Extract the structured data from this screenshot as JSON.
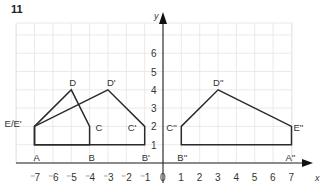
{
  "question_number": "11",
  "chart_data": {
    "type": "diagram",
    "title": "",
    "xlabel": "x",
    "ylabel": "y",
    "xlim": [
      -8,
      7.5
    ],
    "ylim": [
      0,
      7.7
    ],
    "grid": true,
    "x_ticks": [
      "-7",
      "-6",
      "-5",
      "-4",
      "-3",
      "-2",
      "-1",
      "0",
      "1",
      "2",
      "3",
      "4",
      "5",
      "6",
      "7"
    ],
    "y_ticks": [
      "1",
      "2",
      "3",
      "4",
      "5",
      "6"
    ],
    "shapes": [
      {
        "name": "ABCDE",
        "points": [
          {
            "label": "A",
            "x": -7,
            "y": 1
          },
          {
            "label": "B",
            "x": -4,
            "y": 1
          },
          {
            "label": "C",
            "x": -4,
            "y": 2
          },
          {
            "label": "D",
            "x": -5,
            "y": 4
          },
          {
            "label": "E",
            "x": -7,
            "y": 2
          }
        ]
      },
      {
        "name": "A'B'C'D'E'",
        "points": [
          {
            "label": "A'",
            "x": -7,
            "y": 1
          },
          {
            "label": "B'",
            "x": -1,
            "y": 1
          },
          {
            "label": "C'",
            "x": -1,
            "y": 2
          },
          {
            "label": "D'",
            "x": -3,
            "y": 4
          },
          {
            "label": "E'",
            "x": -7,
            "y": 2
          }
        ]
      },
      {
        "name": "A''B''C''D''E''",
        "points": [
          {
            "label": "A''",
            "x": 7,
            "y": 1
          },
          {
            "label": "B''",
            "x": 1,
            "y": 1
          },
          {
            "label": "C''",
            "x": 1,
            "y": 2
          },
          {
            "label": "D''",
            "x": 3,
            "y": 4
          },
          {
            "label": "E''",
            "x": 7,
            "y": 2
          }
        ]
      }
    ],
    "point_labels": [
      {
        "text": "A",
        "x": -7,
        "y": 1
      },
      {
        "text": "B",
        "x": -4,
        "y": 1
      },
      {
        "text": "C",
        "x": -4,
        "y": 2
      },
      {
        "text": "D",
        "x": -5,
        "y": 4
      },
      {
        "text": "E/E'",
        "x": -7,
        "y": 2
      },
      {
        "text": "B'",
        "x": -1,
        "y": 1
      },
      {
        "text": "C'",
        "x": -1,
        "y": 2
      },
      {
        "text": "D'",
        "x": -3,
        "y": 4
      },
      {
        "text": "B''",
        "x": 1,
        "y": 1
      },
      {
        "text": "C''",
        "x": 1,
        "y": 2
      },
      {
        "text": "D''",
        "x": 3,
        "y": 4
      },
      {
        "text": "E''",
        "x": 7,
        "y": 2
      },
      {
        "text": "A''",
        "x": 7,
        "y": 1
      }
    ]
  }
}
